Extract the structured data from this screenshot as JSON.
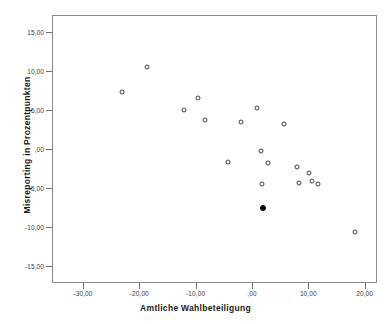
{
  "chart_data": {
    "type": "scatter",
    "title": "",
    "xlabel": "Amtliche Wahlbeteiligung",
    "ylabel": "Misreporting in Prozentpunkten",
    "xlim": [
      -35.5,
      22.2
    ],
    "ylim": [
      -17.2,
      17.2
    ],
    "grid": false,
    "legend": null,
    "xticks": [
      -30,
      -20,
      -10,
      0,
      10,
      20
    ],
    "xticklabels": [
      "-30,00",
      "-20,00",
      "-10,00",
      ",00",
      "10,00",
      "20,00"
    ],
    "yticks": [
      15,
      10,
      5,
      0,
      -5,
      -10,
      -15
    ],
    "yticklabels": [
      "15,00",
      "10,00",
      "5,00",
      ",00",
      "-5,00",
      "-10,00",
      "-15,00"
    ],
    "series": [
      {
        "name": "offene Marker",
        "marker": "open-circle",
        "color": "#3c3c3c",
        "points": [
          {
            "x": -23.2,
            "y": 7.4
          },
          {
            "x": -18.8,
            "y": 10.6
          },
          {
            "x": -12.2,
            "y": 5.1
          },
          {
            "x": -9.8,
            "y": 6.7
          },
          {
            "x": -8.6,
            "y": 3.8
          },
          {
            "x": -4.4,
            "y": -1.5
          },
          {
            "x": -2.2,
            "y": 3.6
          },
          {
            "x": 0.7,
            "y": 5.4
          },
          {
            "x": 1.4,
            "y": -0.1
          },
          {
            "x": 1.6,
            "y": -4.3
          },
          {
            "x": 2.6,
            "y": -1.7
          },
          {
            "x": 5.6,
            "y": 3.3
          },
          {
            "x": 7.9,
            "y": -2.2
          },
          {
            "x": 8.2,
            "y": -4.2
          },
          {
            "x": 9.9,
            "y": -2.9
          },
          {
            "x": 10.4,
            "y": -4.0
          },
          {
            "x": 11.5,
            "y": -4.4
          },
          {
            "x": 18.2,
            "y": -10.5
          }
        ]
      },
      {
        "name": "gefuellter Marker",
        "marker": "filled-circle",
        "color": "#000000",
        "points": [
          {
            "x": 1.8,
            "y": -7.5
          }
        ]
      }
    ]
  }
}
